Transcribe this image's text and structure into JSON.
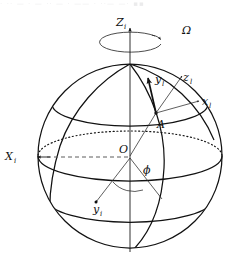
{
  "figure": {
    "type": "geometric-diagram",
    "width": 250,
    "height": 272,
    "background_color": "#ffffff",
    "line_color": "#121212"
  },
  "scan_artifact": {
    "visible_text": "· ·· — · — ·· — · —— · ··— —· ▪▪",
    "description": "faint cropped text row at top edge"
  },
  "labels": {
    "rotation_rate": {
      "text": "Ω",
      "name": "angular-velocity",
      "x": 182,
      "y": 34
    },
    "inertial_z": {
      "base": "Z",
      "sub": "i",
      "name": "inertial-z-axis",
      "x": 118,
      "y": 26
    },
    "inertial_x": {
      "base": "X",
      "sub": "i",
      "name": "inertial-x-axis",
      "x": 7,
      "y": 160
    },
    "inertial_y": {
      "base": "y",
      "sub": "i",
      "name": "inertial-y-axis",
      "x": 95,
      "y": 213
    },
    "origin": {
      "text": "O",
      "name": "sphere-origin",
      "x": 121,
      "y": 163
    },
    "longitude_angle": {
      "text": "ϕ",
      "name": "longitude-angle-phi",
      "x": 145,
      "y": 172
    },
    "point_a": {
      "text": "A",
      "name": "surface-point-a",
      "x": 159,
      "y": 127
    },
    "local_x": {
      "base": "x",
      "sub": "l",
      "name": "local-x-axis",
      "x": 204,
      "y": 105
    },
    "local_y": {
      "base": "y",
      "sub": "l",
      "name": "local-y-axis",
      "x": 157,
      "y": 83
    },
    "local_z": {
      "base": "z",
      "sub": "l",
      "name": "local-z-axis",
      "x": 184,
      "y": 81
    }
  },
  "geometry": {
    "sphere": {
      "center_x": 130,
      "center_y": 156,
      "radius": 92
    },
    "rotation_ellipse": {
      "cx": 130,
      "cy": 44,
      "rx": 31,
      "ry": 10
    },
    "point_a": {
      "x": 156,
      "y": 113
    },
    "equator": {
      "rx": 92,
      "ry": 25
    },
    "upper_latitude": {
      "ry_offset": -52,
      "rx": 76,
      "ry": 20
    },
    "lower_latitude": {
      "ry_offset": 46,
      "rx": 80,
      "ry": 21
    }
  }
}
